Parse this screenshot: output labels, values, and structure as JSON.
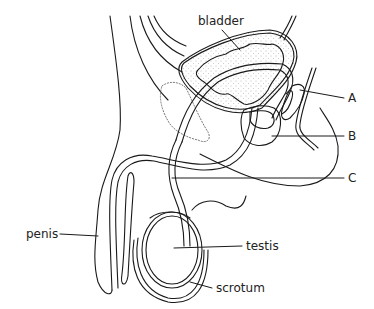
{
  "figure": {
    "colors": {
      "line": "#1a1a1a",
      "text": "#222222",
      "background": "#ffffff"
    }
  },
  "labels": {
    "bladder": "bladder",
    "a": "A",
    "b": "B",
    "c": "C",
    "penis": "penis",
    "testis": "testis",
    "scrotum": "scrotum"
  }
}
